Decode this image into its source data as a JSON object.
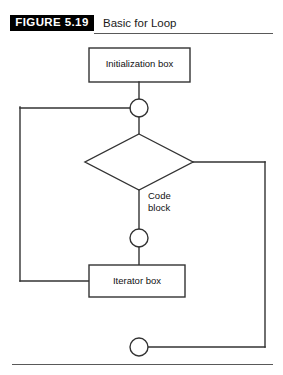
{
  "figure": {
    "banner_label": "FIGURE 5.19",
    "title": "Basic for Loop"
  },
  "diagram": {
    "type": "flowchart",
    "nodes": [
      {
        "id": "initialization",
        "shape": "rectangle",
        "label": "Initialization box"
      },
      {
        "id": "junction-top",
        "shape": "circle",
        "label": ""
      },
      {
        "id": "condition",
        "shape": "diamond",
        "label": ""
      },
      {
        "id": "code-block",
        "shape": "label",
        "label_line1": "Code",
        "label_line2": "block"
      },
      {
        "id": "junction-middle",
        "shape": "circle",
        "label": ""
      },
      {
        "id": "iterator",
        "shape": "rectangle",
        "label": "Iterator box"
      },
      {
        "id": "junction-bottom",
        "shape": "circle",
        "label": ""
      }
    ],
    "colors": {
      "stroke": "#333333",
      "banner_bg": "#000000",
      "banner_text": "#ffffff",
      "background": "#ffffff",
      "rule": "#595959"
    }
  }
}
